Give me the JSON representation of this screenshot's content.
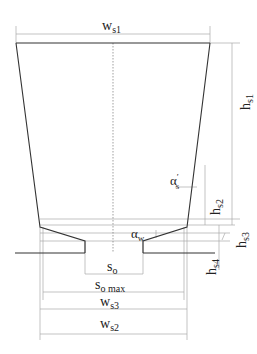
{
  "diagram": {
    "labels": {
      "ws1": {
        "main": "w",
        "sub": "s1"
      },
      "hs1": {
        "main": "h",
        "sub": "s1"
      },
      "alpha_s": {
        "main": "α",
        "sup": "′",
        "sub": "s"
      },
      "hs2": {
        "main": "h",
        "sub": "s2"
      },
      "alpha_w": {
        "main": "α",
        "sub": "w"
      },
      "hs3": {
        "main": "h",
        "sub": "s3"
      },
      "hs4": {
        "main": "h",
        "sub": "s4"
      },
      "so": {
        "main": "s",
        "sub": "o"
      },
      "so_max": {
        "main": "s",
        "sub": "o max"
      },
      "ws3": {
        "main": "w",
        "sub": "s3"
      },
      "ws2": {
        "main": "w",
        "sub": "s2"
      }
    },
    "colors": {
      "outline": "#333333",
      "dimension": "#999999",
      "text": "#222222"
    }
  }
}
